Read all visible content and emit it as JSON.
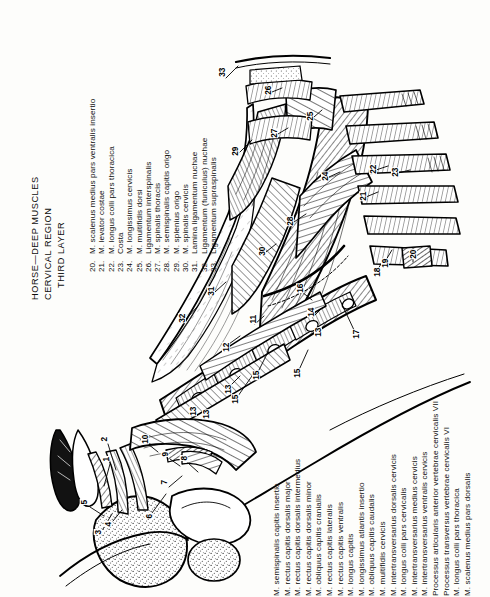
{
  "plate": {
    "title_lines": [
      "HORSE—DEEP MUSCLES",
      "CERVICAL REGION",
      "THIRD LAYER"
    ],
    "orientation": "text rotated 90 degrees counter-clockwise",
    "ink_color": "#0e0e0e",
    "background_color": "#fdfdfb"
  },
  "legend_lower": {
    "note": "numbers cropped off bottom edge of page",
    "entries": [
      {
        "num": "1.",
        "label": "M. semispinalis capitis insertio"
      },
      {
        "num": "2.",
        "label": "M. rectus capitis dorsalis major"
      },
      {
        "num": "3.",
        "label": "M. rectus capitis dorsalis intermedius"
      },
      {
        "num": "4.",
        "label": "M. rectus capitis dorsalis minor"
      },
      {
        "num": "5.",
        "label": "M. obliquus capitis cranialis"
      },
      {
        "num": "6.",
        "label": "M. rectus capitis lateralis"
      },
      {
        "num": "7.",
        "label": "M. rectus capitis ventralis"
      },
      {
        "num": "8.",
        "label": "M. longus capitis"
      },
      {
        "num": "9.",
        "label": "M. longissimus atlantis insertio"
      },
      {
        "num": "10.",
        "label": "M. obliquus capitis caudalis"
      },
      {
        "num": "11.",
        "label": "M. multifidis cervicis"
      },
      {
        "num": "12.",
        "label": "M. intertransversarius dorsalis cervicis"
      },
      {
        "num": "13.",
        "label": "M. longus colli pars cervicalis"
      },
      {
        "num": "14.",
        "label": "M. intertransversarius medius cervicis"
      },
      {
        "num": "15.",
        "label": "M. intertransversarius ventralis cervicis"
      },
      {
        "num": "16.",
        "label": "Processus articularis anterior vertebrae cervicalis VII"
      },
      {
        "num": "17.",
        "label": "Processus transversus vertebrae cervicalis VI"
      },
      {
        "num": "18.",
        "label": "M. longus colli pars thoracica"
      },
      {
        "num": "19.",
        "label": "M. scalenus medius pars dorsalis"
      }
    ]
  },
  "legend_upper": {
    "entries": [
      {
        "num": "20.",
        "label": "M. scalenus medius pars ventralis insertio"
      },
      {
        "num": "21.",
        "label": "M. levator costae"
      },
      {
        "num": "22.",
        "label": "M. longus colli pars thoracica"
      },
      {
        "num": "23.",
        "label": "Costa"
      },
      {
        "num": "24.",
        "label": "M. longissimus cervicis"
      },
      {
        "num": "25.",
        "label": "M. multifidis dorsi"
      },
      {
        "num": "26.",
        "label": "Ligamentum interspinalis"
      },
      {
        "num": "27.",
        "label": "M. spinalis thoracis"
      },
      {
        "num": "28.",
        "label": "M. semispinalis capitis origo"
      },
      {
        "num": "29.",
        "label": "M. splenius origo"
      },
      {
        "num": "30.",
        "label": "M. spinalis cervicis"
      },
      {
        "num": "31.",
        "label": "Lamina ligamentum nuchae"
      },
      {
        "num": "32.",
        "label": "Ligamentum (funiculus) nuchae"
      },
      {
        "num": "33.",
        "label": "Ligamentum supraspinalis"
      }
    ]
  },
  "callouts": [
    {
      "id": "1",
      "x": 108,
      "y": 460
    },
    {
      "id": "2",
      "x": 106,
      "y": 440
    },
    {
      "id": "3",
      "x": 100,
      "y": 533
    },
    {
      "id": "4",
      "x": 110,
      "y": 525
    },
    {
      "id": "5",
      "x": 86,
      "y": 503
    },
    {
      "id": "6",
      "x": 151,
      "y": 517
    },
    {
      "id": "7",
      "x": 166,
      "y": 483
    },
    {
      "id": "8",
      "x": 186,
      "y": 459
    },
    {
      "id": "9",
      "x": 167,
      "y": 455
    },
    {
      "id": "10",
      "x": 145,
      "y": 440
    },
    {
      "id": "11",
      "x": 253,
      "y": 320
    },
    {
      "id": "12",
      "x": 226,
      "y": 348
    },
    {
      "id": "13",
      "x": 228,
      "y": 390
    },
    {
      "id": "13b",
      "x": 206,
      "y": 415
    },
    {
      "id": "13c",
      "x": 318,
      "y": 333
    },
    {
      "id": "13d",
      "x": 193,
      "y": 412
    },
    {
      "id": "14",
      "x": 311,
      "y": 313
    },
    {
      "id": "15",
      "x": 256,
      "y": 376
    },
    {
      "id": "15b",
      "x": 297,
      "y": 374
    },
    {
      "id": "15c",
      "x": 235,
      "y": 400
    },
    {
      "id": "16",
      "x": 300,
      "y": 289
    },
    {
      "id": "17",
      "x": 356,
      "y": 335
    },
    {
      "id": "18",
      "x": 377,
      "y": 273
    },
    {
      "id": "19",
      "x": 385,
      "y": 264
    },
    {
      "id": "20",
      "x": 413,
      "y": 255
    },
    {
      "id": "21",
      "x": 363,
      "y": 197
    },
    {
      "id": "22",
      "x": 373,
      "y": 170
    },
    {
      "id": "23",
      "x": 395,
      "y": 173
    },
    {
      "id": "24",
      "x": 325,
      "y": 177
    },
    {
      "id": "25",
      "x": 310,
      "y": 117
    },
    {
      "id": "26",
      "x": 268,
      "y": 91
    },
    {
      "id": "27",
      "x": 274,
      "y": 134
    },
    {
      "id": "28",
      "x": 290,
      "y": 222
    },
    {
      "id": "29",
      "x": 235,
      "y": 152
    },
    {
      "id": "30",
      "x": 262,
      "y": 252
    },
    {
      "id": "31",
      "x": 211,
      "y": 292
    },
    {
      "id": "32",
      "x": 182,
      "y": 319
    },
    {
      "id": "33",
      "x": 222,
      "y": 73
    }
  ]
}
